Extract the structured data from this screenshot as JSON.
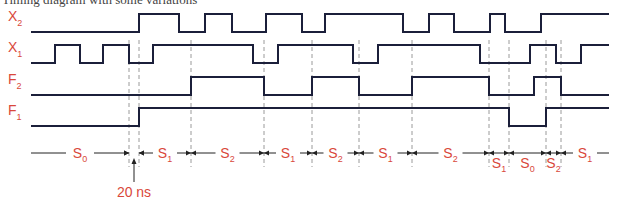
{
  "caption": "Timing diagram with some variations",
  "colors": {
    "label": "#d9483b",
    "trace": "#1b1f3a",
    "guide": "#9a9a9a"
  },
  "signals": [
    {
      "name": "X",
      "sub": "2",
      "start": 0,
      "transitions": [
        139,
        179,
        205,
        232,
        266,
        302,
        325,
        403,
        429,
        454,
        490,
        505,
        541
      ]
    },
    {
      "name": "X",
      "sub": "1",
      "start": 0,
      "transitions": [
        55,
        80,
        103,
        129,
        153,
        253,
        278,
        353,
        378,
        480,
        530,
        556,
        581
      ]
    },
    {
      "name": "F",
      "sub": "2",
      "start": 0,
      "transitions": [
        191,
        264,
        312,
        359,
        412,
        489,
        534,
        561
      ]
    },
    {
      "name": "F",
      "sub": "1",
      "start": 0,
      "transitions": [
        139,
        509,
        546
      ]
    }
  ],
  "guides": [
    129,
    139,
    191,
    264,
    312,
    359,
    412,
    489,
    509,
    546,
    561
  ],
  "states": [
    {
      "name": "S",
      "sub": "0",
      "from": 31,
      "to": 129
    },
    {
      "name": "S",
      "sub": "1",
      "from": 139,
      "to": 191
    },
    {
      "name": "S",
      "sub": "2",
      "from": 191,
      "to": 264
    },
    {
      "name": "S",
      "sub": "1",
      "from": 264,
      "to": 312
    },
    {
      "name": "S",
      "sub": "2",
      "from": 312,
      "to": 359
    },
    {
      "name": "S",
      "sub": "1",
      "from": 359,
      "to": 412
    },
    {
      "name": "S",
      "sub": "2",
      "from": 412,
      "to": 489
    },
    {
      "name": "S",
      "sub": "1",
      "from": 489,
      "to": 509,
      "below": true
    },
    {
      "name": "S",
      "sub": "0",
      "from": 509,
      "to": 546,
      "below": true
    },
    {
      "name": "S",
      "sub": "2",
      "from": 546,
      "to": 561,
      "below": true
    },
    {
      "name": "S",
      "sub": "1",
      "from": 561,
      "to": 609
    }
  ],
  "annotation": {
    "label": "20 ns",
    "from": 129,
    "to": 139
  }
}
